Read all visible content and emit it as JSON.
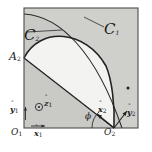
{
  "figure": {
    "type": "geometric-diagram",
    "title_visible": false,
    "colors": {
      "frame_stroke": "#4d4d4d",
      "outer_fill": "#c9c9c6",
      "mid_fill": "#d2d2cf",
      "lens_fill": "#f3f3f1",
      "curve_stroke": "#2b2b2b",
      "label_color": "#1a1a1a",
      "page_background": "#ffffff"
    },
    "frame": {
      "x": 24,
      "y": 8,
      "width": 114,
      "height": 120
    }
  },
  "labels": {
    "curve_c1": {
      "letter": "C",
      "sub": "1"
    },
    "curve_c2": {
      "letter": "C",
      "sub": "2"
    },
    "point_a2": {
      "letter": "A",
      "sub": "2"
    },
    "origin_1": {
      "letter": "O",
      "sub": "1"
    },
    "origin_2": {
      "letter": "O",
      "sub": "2"
    },
    "axis_x1": {
      "letter": "x",
      "sub": "1",
      "hat": "ˆ"
    },
    "axis_y1": {
      "letter": "y",
      "sub": "1",
      "hat": "ˆ"
    },
    "axis_z1": {
      "letter": "z",
      "sub": "1",
      "hat": "ˆ",
      "glyph": "⊙"
    },
    "axis_x2": {
      "letter": "x",
      "sub": "2",
      "hat": "ˆ"
    },
    "axis_y2": {
      "letter": "y",
      "sub": "2",
      "hat": "ˆ"
    },
    "angle_phi": {
      "symbol": "ϕ"
    }
  },
  "geometry": {
    "chord_a2_to_o2": {
      "from": [
        24,
        58
      ],
      "to": [
        114,
        128
      ]
    },
    "lens_arc": {
      "from": [
        24,
        58
      ],
      "to": [
        114,
        128
      ],
      "bulge": "upper-right"
    },
    "outer_arc_c1": {
      "from": [
        24,
        14
      ],
      "to": [
        122,
        128
      ]
    },
    "marker_dot_on_arc": {
      "x": 128,
      "y": 88
    },
    "phi_arc_center": [
      114,
      128
    ],
    "x2_axis_vector": {
      "from": [
        114,
        128
      ],
      "to": [
        96,
        114
      ]
    },
    "y2_axis_vector": {
      "from": [
        114,
        128
      ],
      "to": [
        128,
        112
      ]
    },
    "x1_axis_vector": {
      "from": [
        32,
        128
      ],
      "to": [
        46,
        128
      ]
    },
    "y1_axis_vector": {
      "from": [
        24,
        120
      ],
      "to": [
        24,
        106
      ]
    },
    "z1_marker": {
      "x": 41,
      "y": 106
    }
  }
}
